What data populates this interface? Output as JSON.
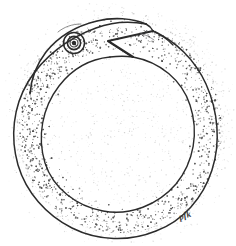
{
  "artwork": {
    "title": "Ouroboros",
    "subject": "snake-eating-its-own-tail",
    "medium": "pen-and-ink stipple drawing",
    "paper_color": "#ffffff",
    "ink_color": "#2b2b2b",
    "stipple_color": "#4a4a4a",
    "canvas": {
      "width": 236,
      "height": 246
    },
    "signature": "pfk",
    "elements": {
      "outer_contour_label": "serpent outer body contour",
      "inner_contour_label": "serpent inner body contour",
      "head_label": "serpent head",
      "eye_label": "serpent eye",
      "mouth_label": "open jaws biting tail",
      "tail_label": "serpent tail entering mouth",
      "shading_label": "stipple shading band"
    },
    "geometry": {
      "outer_circle": {
        "cx": 120,
        "cy": 126,
        "rx": 102,
        "ry": 107
      },
      "inner_circle": {
        "cx": 121,
        "cy": 133,
        "rx": 72,
        "ry": 76
      },
      "eye": {
        "cx": 74,
        "cy": 43,
        "r_outer": 10.5,
        "r_mid": 6.5,
        "r_pupil": 2.6
      },
      "signature_pos": {
        "x": 180,
        "y": 220
      }
    },
    "stipple": {
      "band_dot_count": 2600,
      "interior_dot_count": 520,
      "halo_dot_count": 900
    }
  }
}
